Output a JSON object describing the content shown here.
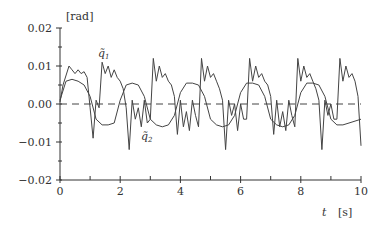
{
  "chart_data": {
    "type": "line",
    "title": "",
    "xlabel": "t [s]",
    "ylabel": "[rad]",
    "xlim": [
      0,
      10
    ],
    "ylim": [
      -0.02,
      0.02
    ],
    "x_ticks": [
      "0",
      "2",
      "4",
      "6",
      "8",
      "10"
    ],
    "y_ticks": [
      "0.02",
      "0.01",
      "0.00",
      "−0.01",
      "−0.02"
    ],
    "grid": false,
    "reference_line": {
      "y": 0.0,
      "style": "dashed"
    },
    "series": [
      {
        "name": "q̃1",
        "x": [
          0,
          0.1,
          0.3,
          0.4,
          0.5,
          0.6,
          0.7,
          0.8,
          0.9,
          1.0,
          1.1,
          1.2,
          1.3,
          1.4,
          1.5,
          1.6,
          1.7,
          1.8,
          1.9,
          2.0,
          2.1,
          2.2,
          2.3,
          2.4,
          2.5,
          2.6,
          2.7,
          2.8,
          2.9,
          3.0,
          3.1,
          3.2,
          3.3,
          3.4,
          3.5,
          3.6,
          3.7,
          3.8,
          3.9,
          4.0,
          4.1,
          4.2,
          4.3,
          4.4,
          4.5,
          4.6,
          4.7,
          4.8,
          4.9,
          5.0,
          5.1,
          5.2,
          5.3,
          5.4,
          5.5,
          5.6,
          5.7,
          5.8,
          5.9,
          6.0,
          6.1,
          6.2,
          6.3,
          6.4,
          6.5,
          6.6,
          6.7,
          6.8,
          6.9,
          7.0,
          7.1,
          7.2,
          7.3,
          7.4,
          7.5,
          7.6,
          7.7,
          7.8,
          7.9,
          8.0,
          8.1,
          8.2,
          8.3,
          8.4,
          8.5,
          8.6,
          8.7,
          8.8,
          8.9,
          9.0,
          9.1,
          9.2,
          9.3,
          9.4,
          9.5,
          9.6,
          9.7,
          9.8,
          9.9,
          10.0
        ],
        "values": [
          0.0005,
          0.005,
          0.01,
          0.009,
          0.008,
          0.009,
          0.008,
          0.0085,
          0.007,
          -0.001,
          -0.009,
          0.001,
          -0.001,
          0.011,
          0.008,
          0.01,
          0.007,
          0.009,
          0.007,
          0.006,
          0.004,
          -0.001,
          -0.012,
          0.001,
          -0.004,
          -0.001,
          -0.006,
          0.001,
          -0.005,
          -0.004,
          0.012,
          0.006,
          0.01,
          0.007,
          0.008,
          0.006,
          0.005,
          0.002,
          -0.008,
          0.001,
          -0.006,
          -0.002,
          -0.007,
          0.001,
          -0.003,
          -0.006,
          0.012,
          0.006,
          0.01,
          0.007,
          0.008,
          0.006,
          0.004,
          0.001,
          -0.012,
          0.001,
          -0.003,
          0.0,
          -0.007,
          0.0,
          -0.004,
          -0.004,
          0.012,
          0.006,
          0.01,
          0.007,
          0.008,
          0.006,
          0.005,
          0.002,
          -0.008,
          0.001,
          -0.006,
          -0.002,
          -0.007,
          0.001,
          -0.003,
          -0.006,
          0.012,
          0.006,
          0.01,
          0.007,
          0.008,
          0.006,
          0.004,
          0.001,
          -0.012,
          0.001,
          -0.003,
          0.0,
          -0.004,
          -0.004,
          0.012,
          0.006,
          0.01,
          0.007,
          0.008,
          0.006,
          0.002,
          -0.011
        ]
      },
      {
        "name": "q̃2",
        "x": [
          0,
          0.2,
          0.4,
          0.6,
          0.8,
          1.0,
          1.2,
          1.4,
          1.6,
          1.8,
          2.0,
          2.2,
          2.4,
          2.6,
          2.8,
          3.0,
          3.2,
          3.4,
          3.6,
          3.8,
          4.0,
          4.2,
          4.4,
          4.6,
          4.8,
          5.0,
          5.2,
          5.4,
          5.6,
          5.8,
          6.0,
          6.2,
          6.4,
          6.6,
          6.8,
          7.0,
          7.2,
          7.4,
          7.6,
          7.8,
          8.0,
          8.2,
          8.4,
          8.6,
          8.8,
          9.0,
          9.2,
          9.4,
          9.6,
          9.8,
          10.0
        ],
        "values": [
          0.001,
          0.006,
          0.0065,
          0.006,
          0.005,
          0.002,
          -0.004,
          -0.0055,
          -0.0055,
          -0.005,
          0.001,
          0.005,
          0.0055,
          0.005,
          0.002,
          -0.004,
          -0.0055,
          -0.006,
          -0.0055,
          -0.003,
          0.003,
          0.0055,
          0.0055,
          0.005,
          0.002,
          -0.004,
          -0.0055,
          -0.006,
          -0.0055,
          -0.003,
          0.003,
          0.0055,
          0.0055,
          0.005,
          0.002,
          -0.004,
          -0.0055,
          -0.006,
          -0.0055,
          -0.003,
          0.003,
          0.0055,
          0.0055,
          0.005,
          0.002,
          -0.004,
          -0.0055,
          -0.0055,
          -0.005,
          -0.0045,
          -0.004
        ]
      }
    ],
    "annotations": [
      {
        "text": "q̃1",
        "x": 1.35,
        "y": 0.0135
      },
      {
        "text": "q̃2",
        "x": 2.6,
        "y": -0.0075
      }
    ]
  },
  "labels": {
    "ylabel": "[rad]",
    "xlabel_var": "t",
    "xlabel_unit": "[s]",
    "q1": "q̃",
    "q1_sub": "1",
    "q2": "q̃",
    "q2_sub": "2"
  }
}
